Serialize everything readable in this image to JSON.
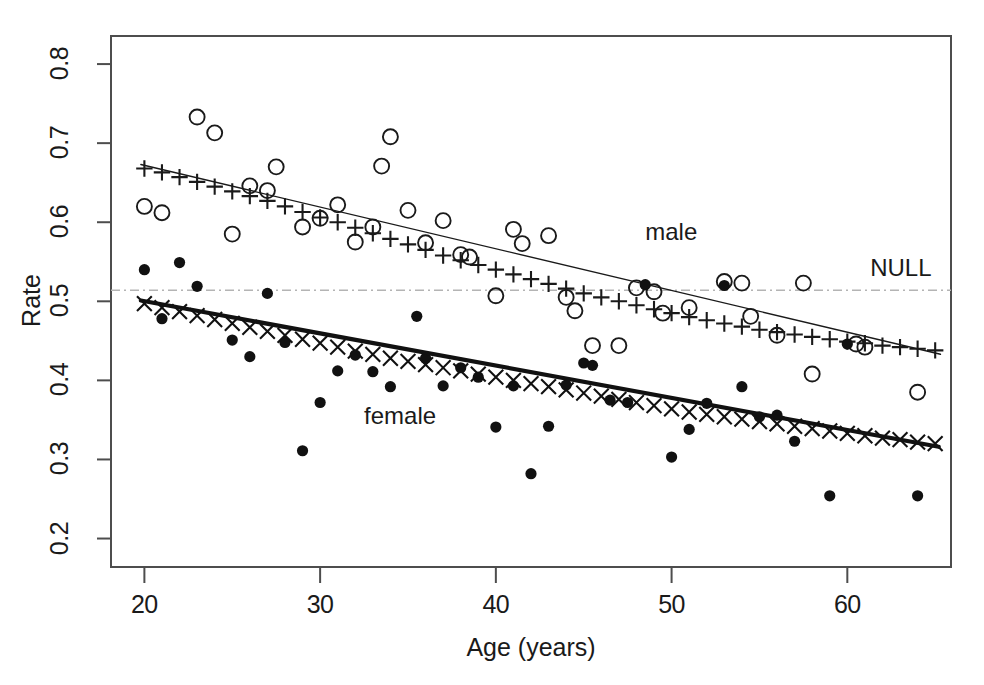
{
  "chart_data": {
    "type": "scatter",
    "title": "",
    "xlabel": "Age (years)",
    "ylabel": "Rate",
    "xlim": [
      18.1,
      65.9
    ],
    "ylim": [
      0.164,
      0.8355
    ],
    "xticks": [
      20,
      30,
      40,
      50,
      60
    ],
    "yticks": [
      0.2,
      0.3,
      0.4,
      0.5,
      0.6,
      0.7,
      0.8
    ],
    "xtick_labels": [
      "20",
      "30",
      "40",
      "50",
      "60"
    ],
    "ytick_labels": [
      "0.2",
      "0.3",
      "0.4",
      "0.5",
      "0.6",
      "0.7",
      "0.8"
    ],
    "grid": false,
    "legend_position": "inline-annotations",
    "annotations": [
      {
        "text": "male",
        "x": 48.5,
        "y": 0.585,
        "name": "male-series-label"
      },
      {
        "text": "female",
        "x": 32.5,
        "y": 0.352,
        "name": "female-series-label"
      },
      {
        "text": "NULL",
        "x": 61.3,
        "y": 0.539,
        "name": "null-line-label"
      }
    ],
    "reference_lines": [
      {
        "name": "null-rate-line",
        "type": "horizontal",
        "y": 0.514,
        "style": "dotdash",
        "color": "#b4b4b4",
        "label": "NULL"
      }
    ],
    "series": [
      {
        "name": "male-observed",
        "label": "male",
        "marker": "open-circle",
        "color": "#1a1a1a",
        "points": [
          [
            20.0,
            0.62
          ],
          [
            21.0,
            0.612
          ],
          [
            23.0,
            0.733
          ],
          [
            24.0,
            0.713
          ],
          [
            25.0,
            0.585
          ],
          [
            26.0,
            0.646
          ],
          [
            27.0,
            0.64
          ],
          [
            27.5,
            0.67
          ],
          [
            29.0,
            0.594
          ],
          [
            30.0,
            0.605
          ],
          [
            31.0,
            0.622
          ],
          [
            32.0,
            0.575
          ],
          [
            33.0,
            0.594
          ],
          [
            33.5,
            0.671
          ],
          [
            34.0,
            0.708
          ],
          [
            35.0,
            0.615
          ],
          [
            36.0,
            0.574
          ],
          [
            37.0,
            0.602
          ],
          [
            38.0,
            0.559
          ],
          [
            38.5,
            0.556
          ],
          [
            40.0,
            0.507
          ],
          [
            41.0,
            0.591
          ],
          [
            41.5,
            0.573
          ],
          [
            43.0,
            0.583
          ],
          [
            44.0,
            0.505
          ],
          [
            44.5,
            0.488
          ],
          [
            45.5,
            0.444
          ],
          [
            47.0,
            0.444
          ],
          [
            48.0,
            0.517
          ],
          [
            49.0,
            0.512
          ],
          [
            49.5,
            0.485
          ],
          [
            51.0,
            0.492
          ],
          [
            53.0,
            0.525
          ],
          [
            54.0,
            0.523
          ],
          [
            54.5,
            0.481
          ],
          [
            56.0,
            0.457
          ],
          [
            57.5,
            0.523
          ],
          [
            58.0,
            0.408
          ],
          [
            60.5,
            0.446
          ],
          [
            61.0,
            0.442
          ],
          [
            64.0,
            0.385
          ]
        ]
      },
      {
        "name": "male-fitted",
        "label": "male fitted",
        "marker": "plus",
        "color": "#1a1a1a",
        "points": [
          [
            20.0,
            0.668
          ],
          [
            21.0,
            0.663
          ],
          [
            22.0,
            0.657
          ],
          [
            23.0,
            0.651
          ],
          [
            24.0,
            0.645
          ],
          [
            25.0,
            0.639
          ],
          [
            26.0,
            0.633
          ],
          [
            27.0,
            0.627
          ],
          [
            28.0,
            0.62
          ],
          [
            29.0,
            0.613
          ],
          [
            30.0,
            0.606
          ],
          [
            31.0,
            0.6
          ],
          [
            32.0,
            0.593
          ],
          [
            33.0,
            0.586
          ],
          [
            34.0,
            0.579
          ],
          [
            35.0,
            0.572
          ],
          [
            36.0,
            0.565
          ],
          [
            37.0,
            0.558
          ],
          [
            38.0,
            0.552
          ],
          [
            39.0,
            0.546
          ],
          [
            40.0,
            0.54
          ],
          [
            41.0,
            0.534
          ],
          [
            42.0,
            0.528
          ],
          [
            43.0,
            0.522
          ],
          [
            44.0,
            0.516
          ],
          [
            45.0,
            0.51
          ],
          [
            46.0,
            0.505
          ],
          [
            47.0,
            0.5
          ],
          [
            48.0,
            0.495
          ],
          [
            49.0,
            0.49
          ],
          [
            50.0,
            0.485
          ],
          [
            51.0,
            0.48
          ],
          [
            52.0,
            0.476
          ],
          [
            53.0,
            0.472
          ],
          [
            54.0,
            0.468
          ],
          [
            55.0,
            0.464
          ],
          [
            56.0,
            0.461
          ],
          [
            57.0,
            0.458
          ],
          [
            58.0,
            0.455
          ],
          [
            59.0,
            0.452
          ],
          [
            60.0,
            0.449
          ],
          [
            61.0,
            0.447
          ],
          [
            62.0,
            0.444
          ],
          [
            63.0,
            0.442
          ],
          [
            64.0,
            0.44
          ],
          [
            65.0,
            0.438
          ]
        ]
      },
      {
        "name": "male-trend-line",
        "label": "male trend",
        "marker": "line",
        "color": "#1a1a1a",
        "linewidth": 1.4,
        "points": [
          [
            19.8,
            0.673
          ],
          [
            65.3,
            0.433
          ]
        ]
      },
      {
        "name": "female-observed",
        "label": "female",
        "marker": "filled-circle",
        "color": "#111111",
        "points": [
          [
            20.0,
            0.54
          ],
          [
            21.0,
            0.478
          ],
          [
            22.0,
            0.549
          ],
          [
            23.0,
            0.519
          ],
          [
            25.0,
            0.451
          ],
          [
            26.0,
            0.43
          ],
          [
            27.0,
            0.51
          ],
          [
            28.0,
            0.448
          ],
          [
            29.0,
            0.311
          ],
          [
            30.0,
            0.372
          ],
          [
            31.0,
            0.412
          ],
          [
            32.0,
            0.432
          ],
          [
            33.0,
            0.411
          ],
          [
            34.0,
            0.392
          ],
          [
            35.5,
            0.481
          ],
          [
            36.0,
            0.428
          ],
          [
            37.0,
            0.393
          ],
          [
            38.0,
            0.416
          ],
          [
            39.0,
            0.404
          ],
          [
            40.0,
            0.341
          ],
          [
            41.0,
            0.393
          ],
          [
            42.0,
            0.282
          ],
          [
            43.0,
            0.342
          ],
          [
            44.0,
            0.394
          ],
          [
            45.0,
            0.422
          ],
          [
            45.5,
            0.419
          ],
          [
            46.5,
            0.375
          ],
          [
            47.5,
            0.372
          ],
          [
            48.5,
            0.521
          ],
          [
            50.0,
            0.303
          ],
          [
            51.0,
            0.338
          ],
          [
            52.0,
            0.371
          ],
          [
            53.0,
            0.52
          ],
          [
            54.0,
            0.392
          ],
          [
            55.0,
            0.354
          ],
          [
            56.0,
            0.356
          ],
          [
            57.0,
            0.323
          ],
          [
            59.0,
            0.254
          ],
          [
            60.0,
            0.446
          ],
          [
            64.0,
            0.254
          ]
        ]
      },
      {
        "name": "female-fitted",
        "label": "female fitted",
        "marker": "cross",
        "color": "#111111",
        "points": [
          [
            20.0,
            0.497
          ],
          [
            21.0,
            0.492
          ],
          [
            22.0,
            0.487
          ],
          [
            23.0,
            0.482
          ],
          [
            24.0,
            0.477
          ],
          [
            25.0,
            0.472
          ],
          [
            26.0,
            0.467
          ],
          [
            27.0,
            0.462
          ],
          [
            28.0,
            0.457
          ],
          [
            29.0,
            0.452
          ],
          [
            30.0,
            0.447
          ],
          [
            31.0,
            0.442
          ],
          [
            32.0,
            0.437
          ],
          [
            33.0,
            0.433
          ],
          [
            34.0,
            0.428
          ],
          [
            35.0,
            0.424
          ],
          [
            36.0,
            0.42
          ],
          [
            37.0,
            0.416
          ],
          [
            38.0,
            0.412
          ],
          [
            39.0,
            0.408
          ],
          [
            40.0,
            0.404
          ],
          [
            41.0,
            0.4
          ],
          [
            42.0,
            0.396
          ],
          [
            43.0,
            0.392
          ],
          [
            44.0,
            0.388
          ],
          [
            45.0,
            0.384
          ],
          [
            46.0,
            0.38
          ],
          [
            47.0,
            0.376
          ],
          [
            48.0,
            0.372
          ],
          [
            49.0,
            0.368
          ],
          [
            50.0,
            0.364
          ],
          [
            51.0,
            0.36
          ],
          [
            52.0,
            0.357
          ],
          [
            53.0,
            0.354
          ],
          [
            54.0,
            0.351
          ],
          [
            55.0,
            0.348
          ],
          [
            56.0,
            0.345
          ],
          [
            57.0,
            0.342
          ],
          [
            58.0,
            0.339
          ],
          [
            59.0,
            0.336
          ],
          [
            60.0,
            0.333
          ],
          [
            61.0,
            0.33
          ],
          [
            62.0,
            0.327
          ],
          [
            63.0,
            0.325
          ],
          [
            64.0,
            0.322
          ],
          [
            65.0,
            0.32
          ]
        ]
      },
      {
        "name": "female-trend-line",
        "label": "female trend",
        "marker": "line",
        "color": "#111111",
        "linewidth": 4.2,
        "points": [
          [
            19.8,
            0.501
          ],
          [
            65.2,
            0.316
          ]
        ]
      }
    ]
  },
  "figure": {
    "background": "#ffffff",
    "frame_color": "#4d4d4d",
    "text_color": "#1a1a1a"
  }
}
